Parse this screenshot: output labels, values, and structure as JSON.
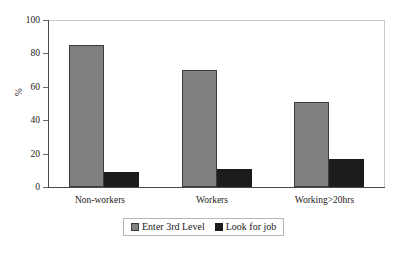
{
  "chart_data": {
    "type": "bar",
    "title": "",
    "subtitle": "",
    "xlabel": "",
    "ylabel": "%",
    "categories": [
      "Non-workers",
      "Workers",
      "Working>20hrs"
    ],
    "series": [
      {
        "name": "Enter 3rd Level",
        "values": [
          85,
          70,
          51
        ],
        "color": "#808080"
      },
      {
        "name": "Look for job",
        "values": [
          9,
          11,
          17
        ],
        "color": "#1c1c1c"
      }
    ],
    "ylim": [
      0,
      100
    ],
    "yticks": [
      0,
      20,
      40,
      60,
      80,
      100
    ],
    "ytick_labels": [
      "0",
      "20",
      "40",
      "60",
      "80",
      "100"
    ],
    "grid": false,
    "legend_position": "bottom-center",
    "legend_entries": [
      "Enter 3rd Level",
      "Look for job"
    ]
  },
  "axis": {
    "y_title": "%",
    "y_labels": {
      "t100": "100",
      "t80": "80",
      "t60": "60",
      "t40": "40",
      "t20": "20",
      "t0": "0"
    }
  },
  "categories": {
    "c0": "Non-workers",
    "c1": "Workers",
    "c2": "Working>20hrs"
  },
  "legend": {
    "entry0": "Enter 3rd Level",
    "entry1": "Look for job"
  }
}
